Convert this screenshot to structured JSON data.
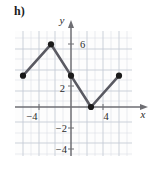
{
  "part_label": "h)",
  "axes": {
    "x_label": "x",
    "y_label": "y",
    "x_ticks": [
      {
        "value": -4,
        "label": "−4"
      },
      {
        "value": 4,
        "label": "4"
      }
    ],
    "y_ticks": [
      {
        "value": 6,
        "label": "6"
      },
      {
        "value": 2,
        "label": "2"
      },
      {
        "value": -2,
        "label": "−2"
      },
      {
        "value": -4,
        "label": "−4"
      }
    ],
    "x_range": [
      -7,
      8
    ],
    "y_range": [
      -5.5,
      7.5
    ],
    "grid": true
  },
  "colors": {
    "grid": "#ccd2dd",
    "grid_major": "#b9c0cc",
    "axis": "#6e6e73",
    "curve": "#5a5a62",
    "point": "#1a1a1a",
    "text": "#2b2b2b",
    "label": "#1a1a1a",
    "background": "#ffffff",
    "panel": "#fdfdfd"
  },
  "chart_data": {
    "type": "line",
    "title": "",
    "xlabel": "x",
    "ylabel": "y",
    "xlim": [
      -7,
      8
    ],
    "ylim": [
      -5.5,
      7.5
    ],
    "grid": true,
    "legend": null,
    "series": [
      {
        "name": "piecewise-linear-function",
        "marker": "filled-circle",
        "points": [
          {
            "x": -6,
            "y": 3
          },
          {
            "x": -2.5,
            "y": 6
          },
          {
            "x": 0,
            "y": 3
          },
          {
            "x": 2.5,
            "y": 0
          },
          {
            "x": 6,
            "y": 3
          }
        ]
      }
    ],
    "x": [
      -6,
      -2.5,
      0,
      2.5,
      6
    ],
    "values": [
      3,
      6,
      3,
      0,
      3
    ]
  }
}
